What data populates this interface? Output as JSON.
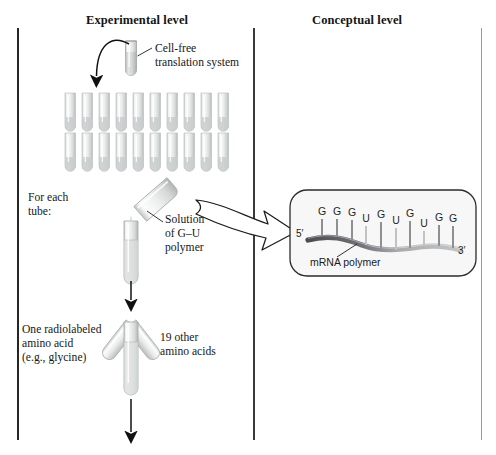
{
  "figure": {
    "title_left": "Experimental level",
    "title_right": "Conceptual level"
  },
  "panels": {
    "experimental": {
      "label": "Experimental level",
      "annotations": {
        "cell_free": "Cell-free\ntranslation system",
        "for_each_tube": "For each\ntube:",
        "solution": "Solution\nof G–U\npolymer",
        "radiolabeled": "One radiolabeled\namino acid\n(e.g., glycine)",
        "other_amino_acids": "19 other\namino acids"
      },
      "tube_rack": {
        "rows": 2,
        "columns": 10,
        "total_tubes": 20
      }
    },
    "conceptual": {
      "label": "Conceptual level",
      "molecule_label": "mRNA polymer",
      "end_label_5": "5′",
      "end_label_3": "3′",
      "sequence": [
        "G",
        "G",
        "G",
        "U",
        "G",
        "U",
        "G",
        "U",
        "G",
        "G"
      ]
    }
  },
  "colors": {
    "ink": "#171717",
    "rule": "#262626",
    "rule_right": "#9a9a9a",
    "glass": "#e9eaea",
    "glass_edge": "#b9bcbc",
    "strand_dark": "#55565a",
    "strand_light": "#b9bbbd",
    "callout_border": "#2b2b2b"
  }
}
